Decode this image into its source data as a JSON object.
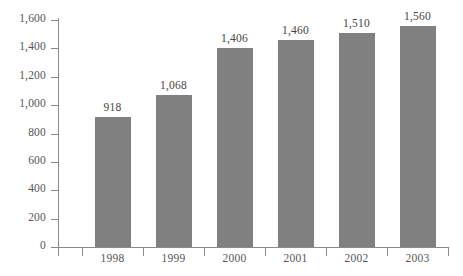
{
  "chart_data": {
    "type": "bar",
    "title": "",
    "subtitle": "",
    "xlabel": "",
    "ylabel": "",
    "categories": [
      "1998",
      "1999",
      "2000",
      "2001",
      "2002",
      "2003"
    ],
    "values": [
      918,
      1068,
      1406,
      1460,
      1510,
      1560
    ],
    "value_labels": [
      "918",
      "1,068",
      "1,406",
      "1,460",
      "1,510",
      "1,560"
    ],
    "ylim": [
      0,
      1600
    ],
    "ytick_values": [
      0,
      200,
      400,
      600,
      800,
      1000,
      1200,
      1400,
      1600
    ],
    "ytick_labels": [
      "0",
      "200",
      "400",
      "600",
      "800",
      "1,000",
      "1,200",
      "1,400",
      "1,600"
    ],
    "grid": false,
    "legend": null,
    "series": [
      {
        "name": "",
        "values": [
          918,
          1068,
          1406,
          1460,
          1510,
          1560
        ]
      }
    ],
    "colors": {
      "bar": "#808080",
      "axis": "#8a8a8a",
      "tick_label": "#555555",
      "value_label": "#444444",
      "background": "#ffffff"
    }
  }
}
